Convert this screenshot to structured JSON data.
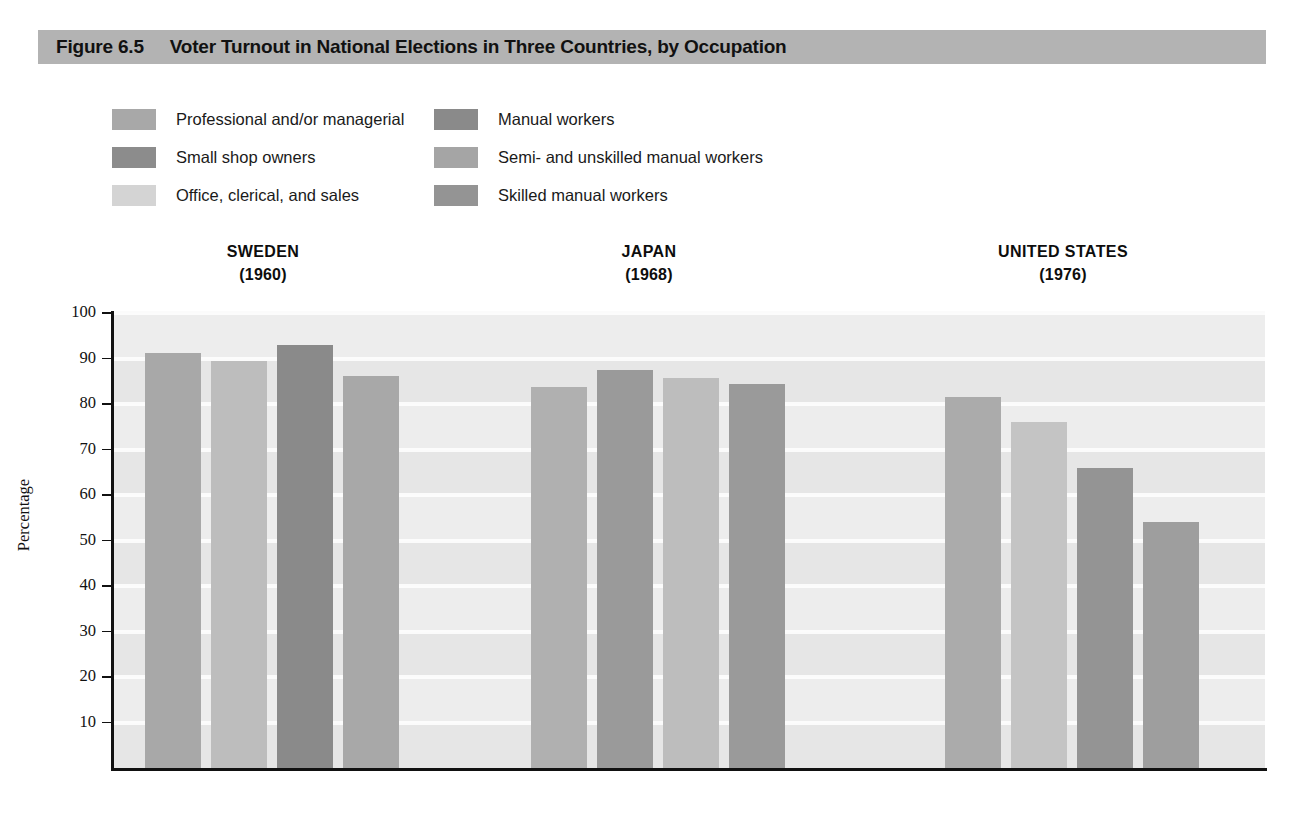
{
  "figure": {
    "number": "Figure 6.5",
    "title": "Voter Turnout in National Elections in Three Countries, by Occupation",
    "banner_color": "#b3b3b3"
  },
  "legend": {
    "left_column": [
      {
        "label": "Professional and/or managerial",
        "color": "#a8a8a8"
      },
      {
        "label": "Small shop owners",
        "color": "#8c8c8c"
      },
      {
        "label": "Office, clerical, and sales",
        "color": "#d4d4d4"
      }
    ],
    "right_column": [
      {
        "label": "Manual workers",
        "color": "#8a8a8a"
      },
      {
        "label": "Semi- and unskilled manual workers",
        "color": "#a5a5a5"
      },
      {
        "label": "Skilled manual workers",
        "color": "#949494"
      }
    ]
  },
  "groups": [
    {
      "country": "SWEDEN",
      "year": "(1960)"
    },
    {
      "country": "JAPAN",
      "year": "(1968)"
    },
    {
      "country": "UNITED STATES",
      "year": "(1976)"
    }
  ],
  "axis": {
    "y_title": "Percentage",
    "y_ticks": [
      "100",
      "90",
      "80",
      "70",
      "60",
      "50",
      "40",
      "30",
      "20",
      "10"
    ],
    "y_min": 0,
    "y_max": 100
  },
  "chart_data": {
    "type": "bar",
    "title": "Voter Turnout in National Elections in Three Countries, by Occupation",
    "xlabel": "",
    "ylabel": "Percentage",
    "ylim": [
      0,
      100
    ],
    "grid": true,
    "legend_position": "top",
    "categories": [
      "SWEDEN (1960)",
      "JAPAN (1968)",
      "UNITED STATES (1976)"
    ],
    "series": [
      {
        "name": "Professional and/or managerial",
        "color": "#a8a8a8",
        "values": [
          91.2,
          null,
          81.5
        ]
      },
      {
        "name": "Small shop owners",
        "color": "#8c8c8c",
        "values": [
          null,
          87.5,
          null
        ]
      },
      {
        "name": "Office, clerical, and sales",
        "color": "#d4d4d4",
        "values": [
          89.4,
          85.8,
          76.0
        ]
      },
      {
        "name": "Manual workers",
        "color": "#8a8a8a",
        "values": [
          93.0,
          null,
          null
        ]
      },
      {
        "name": "Semi- and unskilled manual workers",
        "color": "#a5a5a5",
        "values": [
          null,
          83.8,
          null
        ]
      },
      {
        "name": "Skilled manual workers",
        "color": "#949494",
        "values": [
          86.2,
          84.5,
          66.0
        ]
      }
    ],
    "bars": [
      {
        "group": "SWEDEN (1960)",
        "series": "Professional and/or managerial",
        "value": 91.2,
        "color": "#a8a8a8"
      },
      {
        "group": "SWEDEN (1960)",
        "series": "Office, clerical, and sales",
        "value": 89.4,
        "color": "#bdbdbd"
      },
      {
        "group": "SWEDEN (1960)",
        "series": "Manual workers",
        "value": 93.0,
        "color": "#8a8a8a"
      },
      {
        "group": "SWEDEN (1960)",
        "series": "Skilled manual workers",
        "value": 86.2,
        "color": "#a8a8a8"
      },
      {
        "group": "JAPAN (1968)",
        "series": "Professional and/or managerial",
        "value": 83.8,
        "color": "#b0b0b0"
      },
      {
        "group": "JAPAN (1968)",
        "series": "Small shop owners",
        "value": 87.5,
        "color": "#9a9a9a"
      },
      {
        "group": "JAPAN (1968)",
        "series": "Office, clerical, and sales",
        "value": 85.8,
        "color": "#bdbdbd"
      },
      {
        "group": "JAPAN (1968)",
        "series": "Skilled manual workers",
        "value": 84.5,
        "color": "#9a9a9a"
      },
      {
        "group": "UNITED STATES (1976)",
        "series": "Professional and/or managerial",
        "value": 81.5,
        "color": "#ababab"
      },
      {
        "group": "UNITED STATES (1976)",
        "series": "Office, clerical, and sales",
        "value": 76.0,
        "color": "#c4c4c4"
      },
      {
        "group": "UNITED STATES (1976)",
        "series": "Skilled manual workers",
        "value": 66.0,
        "color": "#949494"
      },
      {
        "group": "UNITED STATES (1976)",
        "series": "Semi- and unskilled manual workers",
        "value": 54.0,
        "color": "#9e9e9e"
      }
    ]
  }
}
